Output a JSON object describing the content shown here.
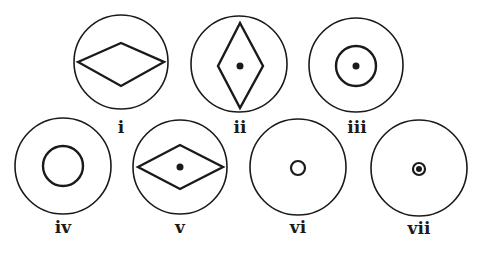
{
  "figures": [
    {
      "id": "i",
      "label": "i",
      "cx": 121,
      "cy": 62,
      "r": 47,
      "inner": "diamond-horizontal",
      "diamond": {
        "left": 78,
        "right": 164,
        "top": 43,
        "bottom": 86
      },
      "dot": false
    },
    {
      "id": "ii",
      "label": "ii",
      "cx": 239,
      "cy": 64,
      "r": 48,
      "inner": "diamond-vertical",
      "diamond": {
        "left": 218,
        "right": 263,
        "top": 23,
        "bottom": 108
      },
      "dot": true
    },
    {
      "id": "iii",
      "label": "iii",
      "cx": 356,
      "cy": 65,
      "r": 47,
      "inner": "circle",
      "inner_r": 20,
      "dot": true
    },
    {
      "id": "iv",
      "label": "iv",
      "cx": 63,
      "cy": 166,
      "r": 48,
      "inner": "circle",
      "inner_r": 20,
      "dot": false
    },
    {
      "id": "v",
      "label": "v",
      "cx": 180,
      "cy": 167,
      "r": 47,
      "inner": "diamond-horizontal",
      "diamond": {
        "left": 138,
        "right": 223,
        "top": 145,
        "bottom": 189
      },
      "dot": true
    },
    {
      "id": "vi",
      "label": "vi",
      "cx": 298,
      "cy": 167,
      "r": 48,
      "inner": "circle",
      "inner_r": 7,
      "dot": false
    },
    {
      "id": "vii",
      "label": "vii",
      "cx": 419,
      "cy": 168,
      "r": 48,
      "inner": "circle",
      "inner_r": 6,
      "dot": true
    }
  ],
  "colors": {
    "stroke": "#1a1a1a",
    "background": "#ffffff"
  }
}
